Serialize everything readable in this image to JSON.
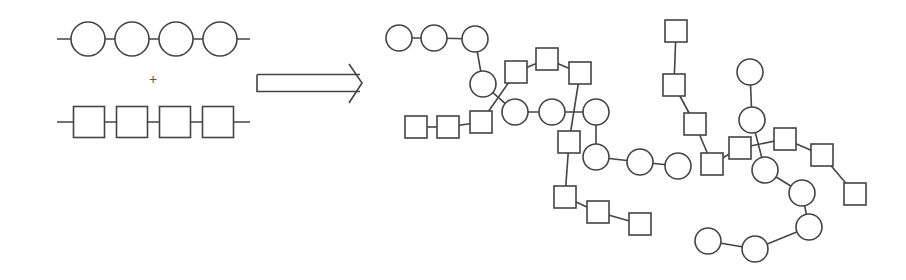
{
  "figure": {
    "colors": {
      "stroke": "#444444",
      "fill": "#ffffff",
      "background": "#ffffff"
    },
    "plus_symbol": "+",
    "reactants": {
      "circle_chain": {
        "y": 39,
        "line": [
          57,
          250
        ],
        "r": 17,
        "centers": [
          88,
          132,
          176,
          220
        ]
      },
      "square_chain": {
        "y": 122,
        "line": [
          57,
          250
        ],
        "size": 31,
        "centers": [
          89,
          132,
          175,
          218
        ]
      }
    },
    "arrow": {
      "x1": 257,
      "x2": 362,
      "y": 83,
      "shaft_half_height": 8.5
    },
    "product": {
      "circle_r": 13,
      "square_size": 22,
      "nodes": [
        {
          "id": "c1",
          "shape": "circle",
          "x": 399,
          "y": 38
        },
        {
          "id": "c2",
          "shape": "circle",
          "x": 434,
          "y": 38
        },
        {
          "id": "c3",
          "shape": "circle",
          "x": 475,
          "y": 39
        },
        {
          "id": "c4",
          "shape": "circle",
          "x": 483,
          "y": 84
        },
        {
          "id": "c5",
          "shape": "circle",
          "x": 515,
          "y": 112
        },
        {
          "id": "c6",
          "shape": "circle",
          "x": 552,
          "y": 112
        },
        {
          "id": "c7",
          "shape": "circle",
          "x": 596,
          "y": 112
        },
        {
          "id": "c8",
          "shape": "circle",
          "x": 596,
          "y": 157
        },
        {
          "id": "c9",
          "shape": "circle",
          "x": 640,
          "y": 162
        },
        {
          "id": "c10",
          "shape": "circle",
          "x": 678,
          "y": 166
        },
        {
          "id": "c11",
          "shape": "circle",
          "x": 750,
          "y": 72
        },
        {
          "id": "c12",
          "shape": "circle",
          "x": 752,
          "y": 120
        },
        {
          "id": "c13",
          "shape": "circle",
          "x": 765,
          "y": 170
        },
        {
          "id": "c14",
          "shape": "circle",
          "x": 802,
          "y": 193
        },
        {
          "id": "c15",
          "shape": "circle",
          "x": 809,
          "y": 227
        },
        {
          "id": "c16",
          "shape": "circle",
          "x": 755,
          "y": 249
        },
        {
          "id": "c17",
          "shape": "circle",
          "x": 708,
          "y": 241
        },
        {
          "id": "s1",
          "shape": "square",
          "x": 416,
          "y": 127
        },
        {
          "id": "s2",
          "shape": "square",
          "x": 448,
          "y": 127
        },
        {
          "id": "s3",
          "shape": "square",
          "x": 481,
          "y": 122
        },
        {
          "id": "s4",
          "shape": "square",
          "x": 516,
          "y": 72
        },
        {
          "id": "s5",
          "shape": "square",
          "x": 547,
          "y": 59
        },
        {
          "id": "s6",
          "shape": "square",
          "x": 580,
          "y": 73
        },
        {
          "id": "s7",
          "shape": "square",
          "x": 569,
          "y": 142
        },
        {
          "id": "s8",
          "shape": "square",
          "x": 565,
          "y": 197
        },
        {
          "id": "s9",
          "shape": "square",
          "x": 598,
          "y": 212
        },
        {
          "id": "s10",
          "shape": "square",
          "x": 640,
          "y": 224
        },
        {
          "id": "s11",
          "shape": "square",
          "x": 676,
          "y": 31
        },
        {
          "id": "s12",
          "shape": "square",
          "x": 674,
          "y": 85
        },
        {
          "id": "s13",
          "shape": "square",
          "x": 695,
          "y": 124
        },
        {
          "id": "s14",
          "shape": "square",
          "x": 712,
          "y": 164
        },
        {
          "id": "s15",
          "shape": "square",
          "x": 740,
          "y": 148
        },
        {
          "id": "s16",
          "shape": "square",
          "x": 785,
          "y": 139
        },
        {
          "id": "s17",
          "shape": "square",
          "x": 822,
          "y": 155
        },
        {
          "id": "s18",
          "shape": "square",
          "x": 855,
          "y": 194
        }
      ],
      "edges": [
        [
          "c1",
          "c2"
        ],
        [
          "c2",
          "c3"
        ],
        [
          "c3",
          "c4"
        ],
        [
          "s1",
          "s2"
        ],
        [
          "s2",
          "s3"
        ],
        [
          "s3",
          "s4"
        ],
        [
          "s4",
          "s5"
        ],
        [
          "s5",
          "s6"
        ],
        [
          "c4",
          "c5"
        ],
        [
          "c5",
          "c6"
        ],
        [
          "c6",
          "c7"
        ],
        [
          "c7",
          "c8"
        ],
        [
          "c8",
          "c9"
        ],
        [
          "c9",
          "c10"
        ],
        [
          "s6",
          "s7"
        ],
        [
          "s7",
          "s8"
        ],
        [
          "s8",
          "s9"
        ],
        [
          "s9",
          "s10"
        ],
        [
          "s11",
          "s12"
        ],
        [
          "s12",
          "s13"
        ],
        [
          "s13",
          "s14"
        ],
        [
          "s14",
          "s15"
        ],
        [
          "s15",
          "s16"
        ],
        [
          "s16",
          "s17"
        ],
        [
          "s17",
          "s18"
        ],
        [
          "c11",
          "c12"
        ],
        [
          "c12",
          "c13"
        ],
        [
          "c13",
          "c14"
        ],
        [
          "c14",
          "c15"
        ],
        [
          "c15",
          "c16"
        ],
        [
          "c16",
          "c17"
        ]
      ]
    }
  }
}
